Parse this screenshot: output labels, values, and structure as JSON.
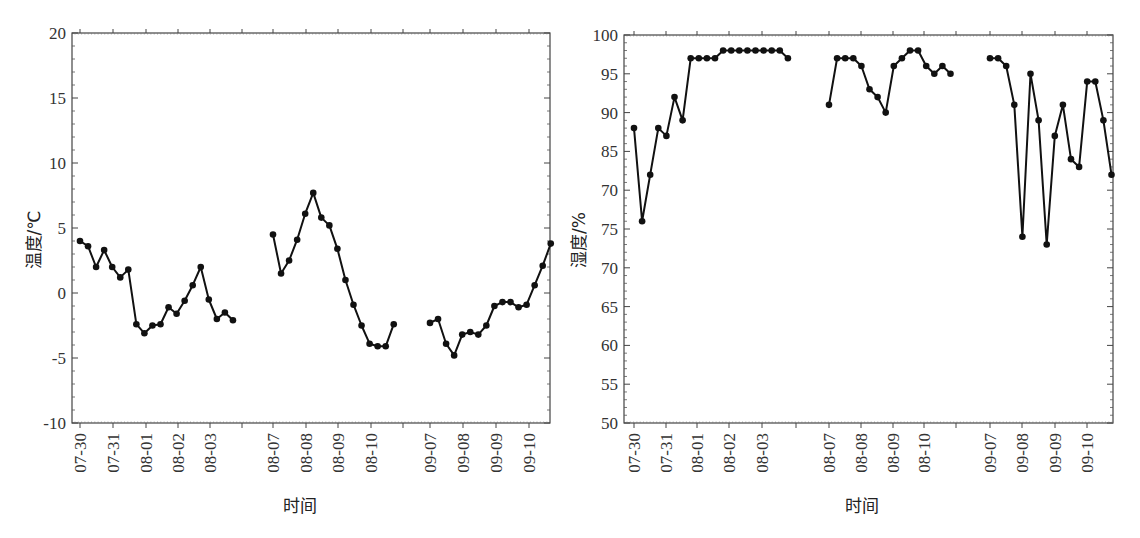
{
  "chart_data": [
    {
      "type": "line",
      "title": "",
      "xlabel": "时间",
      "ylabel": "温度/℃",
      "ylim": [
        -10,
        20
      ],
      "yticks": [
        "20",
        "15",
        "10",
        "5",
        "0",
        "-5",
        "-10"
      ],
      "grid": false,
      "legend": null,
      "x_tick_labels": [
        "07-30",
        "07-31",
        "08-01",
        "08-02",
        "08-03",
        "08-07",
        "08-08",
        "08-09",
        "08-10",
        "09-07",
        "09-08",
        "09-09",
        "09-10"
      ],
      "segments": [
        {
          "name": "07-30 to 08-03",
          "values": [
            4.0,
            3.6,
            2.0,
            3.3,
            2.0,
            1.2,
            1.8,
            -2.4,
            -3.1,
            -2.5,
            -2.4,
            -1.1,
            -1.6,
            -0.6,
            0.6,
            2.0,
            -0.5,
            -2.0,
            -1.5,
            -2.1
          ]
        },
        {
          "name": "08-07 to 08-10",
          "values": [
            4.5,
            1.5,
            2.5,
            4.1,
            6.1,
            7.7,
            5.8,
            5.2,
            3.4,
            1.0,
            -0.9,
            -2.5,
            -3.9,
            -4.1,
            -4.1,
            -2.4
          ]
        },
        {
          "name": "09-07 to 09-10",
          "values": [
            -2.3,
            -2.0,
            -3.9,
            -4.8,
            -3.2,
            -3.0,
            -3.2,
            -2.5,
            -1.0,
            -0.7,
            -0.7,
            -1.1,
            -0.9,
            0.6,
            2.1,
            3.8
          ]
        }
      ]
    },
    {
      "type": "line",
      "title": "",
      "xlabel": "时间",
      "ylabel": "湿度/%",
      "ylim": [
        50,
        100
      ],
      "yticks": [
        "100",
        "95",
        "90",
        "85",
        "70",
        "75",
        "70",
        "65",
        "60",
        "55",
        "50"
      ],
      "ytick_note": "tick labels reproduced as printed; 5th label reads 70 where a linear scale implies 80",
      "grid": false,
      "legend": null,
      "x_tick_labels": [
        "07-30",
        "07-31",
        "08-01",
        "08-02",
        "08-03",
        "08-07",
        "08-08",
        "08-09",
        "08-10",
        "09-07",
        "09-08",
        "09-09",
        "09-10"
      ],
      "segments": [
        {
          "name": "07-30 to 08-03",
          "values": [
            88,
            76,
            82,
            88,
            87,
            92,
            89,
            97,
            97,
            97,
            97,
            98,
            98,
            98,
            98,
            98,
            98,
            98,
            98,
            97
          ]
        },
        {
          "name": "08-07 to 08-10",
          "values": [
            91,
            97,
            97,
            97,
            96,
            93,
            92,
            90,
            96,
            97,
            98,
            98,
            96,
            95,
            96,
            95
          ]
        },
        {
          "name": "09-07 to 09-10",
          "values": [
            97,
            97,
            96,
            91,
            74,
            95,
            89,
            73,
            87,
            91,
            84,
            83,
            94,
            94,
            89,
            82
          ]
        }
      ]
    }
  ]
}
